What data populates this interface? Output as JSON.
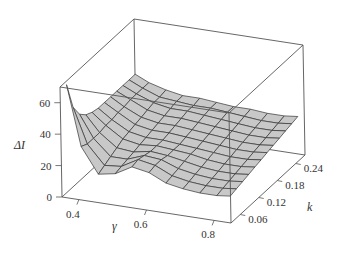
{
  "chart_data": {
    "type": "surface3d",
    "title": "",
    "xlabel": "γ",
    "ylabel": "k",
    "zlabel": "ΔI",
    "x_ticks": [
      "0.4",
      "0.6",
      "0.8"
    ],
    "x_tick_values": [
      0.4,
      0.6,
      0.8
    ],
    "y_ticks": [
      "0.06",
      "0.12",
      "0.18",
      "0.24"
    ],
    "y_tick_values": [
      0.06,
      0.12,
      0.18,
      0.24
    ],
    "z_ticks": [
      "0",
      "20",
      "40",
      "60"
    ],
    "z_tick_values": [
      0,
      20,
      40,
      60
    ],
    "xlim": [
      0.35,
      0.85
    ],
    "ylim": [
      0.03,
      0.27
    ],
    "zlim": [
      0,
      70
    ],
    "grid": false,
    "box": true,
    "surface_description": "Mesh surface: sharp spike up to ~70 at low gamma (~0.36) and low k; dips to ~15 near gamma 0.45, small ridge ~25 around gamma 0.55-0.6 at low k, then a broad plateau around 20-30 sloping gently upward toward high k (~30-35 at k=0.24).",
    "x": [
      0.36,
      0.4,
      0.45,
      0.5,
      0.55,
      0.6,
      0.65,
      0.7,
      0.75,
      0.8,
      0.84
    ],
    "y": [
      0.04,
      0.06,
      0.08,
      0.1,
      0.12,
      0.14,
      0.16,
      0.18,
      0.2,
      0.22,
      0.24,
      0.26
    ],
    "z": [
      [
        70,
        32,
        16,
        18,
        24,
        22,
        17,
        15,
        14,
        14,
        15
      ],
      [
        52,
        30,
        18,
        19,
        25,
        23,
        18,
        16,
        15,
        15,
        16
      ],
      [
        44,
        30,
        20,
        20,
        24,
        23,
        19,
        17,
        16,
        16,
        17
      ],
      [
        40,
        30,
        22,
        21,
        23,
        22,
        20,
        18,
        17,
        17,
        18
      ],
      [
        38,
        31,
        24,
        22,
        23,
        22,
        21,
        19,
        18,
        18,
        19
      ],
      [
        37,
        31,
        25,
        23,
        23,
        22,
        21,
        20,
        19,
        19,
        20
      ],
      [
        37,
        32,
        26,
        24,
        24,
        23,
        22,
        21,
        20,
        20,
        21
      ],
      [
        37,
        32,
        27,
        25,
        25,
        24,
        23,
        22,
        21,
        21,
        22
      ],
      [
        37,
        33,
        28,
        26,
        26,
        25,
        24,
        23,
        22,
        22,
        23
      ],
      [
        37,
        33,
        29,
        27,
        27,
        26,
        25,
        24,
        23,
        23,
        24
      ],
      [
        37,
        33,
        29,
        28,
        27,
        27,
        26,
        25,
        24,
        24,
        25
      ],
      [
        37,
        33,
        30,
        28,
        28,
        27,
        26,
        26,
        25,
        25,
        26
      ]
    ]
  },
  "axes": {
    "z_title": "ΔI",
    "x_title": "γ",
    "y_title": "k"
  },
  "colors": {
    "surface_fill": "#c8c8c8",
    "mesh_line": "#333333",
    "box_line": "#555555",
    "background": "#ffffff"
  }
}
